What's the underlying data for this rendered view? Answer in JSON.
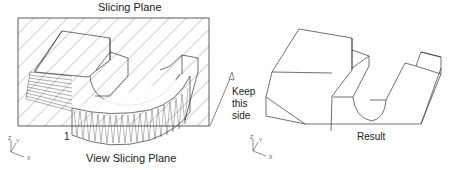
{
  "left_panel": {
    "title": "Slicing Plane",
    "caption": "View Slicing Plane",
    "marker": "1",
    "axes": {
      "z": "Z",
      "y": "Y",
      "x": "X"
    }
  },
  "annotation": {
    "line1": "Keep",
    "line2": "this",
    "line3": "side"
  },
  "right_panel": {
    "caption": "Result",
    "axes": {
      "z": "Z",
      "y": "Y",
      "x": "X"
    }
  }
}
